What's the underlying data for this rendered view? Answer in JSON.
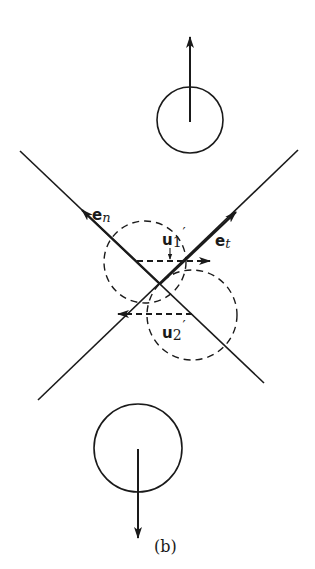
{
  "figure": {
    "caption": "(b)",
    "colors": {
      "ink": "#1a1a1a",
      "background": "#ffffff"
    }
  },
  "labels": {
    "en": {
      "base": "e",
      "sub": "n"
    },
    "et": {
      "base": "e",
      "sub": "t"
    },
    "u1": {
      "base": "u",
      "sub": "1",
      "prime": "′"
    },
    "u2": {
      "base": "u",
      "sub": "2",
      "prime": "′"
    }
  },
  "elements": {
    "top_particle": {
      "cx": 190,
      "cy": 120,
      "r": 33,
      "velocity": "up"
    },
    "bottom_particle": {
      "cx": 138,
      "cy": 448,
      "r": 44,
      "velocity": "down"
    },
    "collision_circle_1": {
      "cx": 145,
      "cy": 262,
      "r": 41,
      "style": "dashed"
    },
    "collision_circle_2": {
      "cx": 192,
      "cy": 315,
      "r": 45,
      "style": "dashed"
    },
    "normal_axis": {
      "from": [
        20,
        151
      ],
      "to": [
        264,
        383
      ]
    },
    "tangent_axis": {
      "from": [
        38,
        400
      ],
      "to": [
        298,
        150
      ]
    }
  }
}
